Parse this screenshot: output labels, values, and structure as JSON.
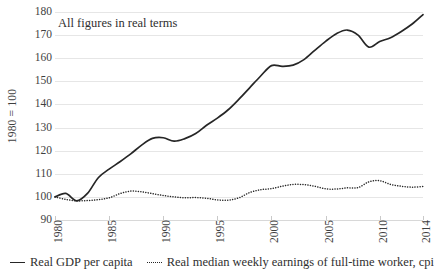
{
  "chart_data": {
    "type": "line",
    "title": "",
    "annotation": "All figures in real terms",
    "xlabel": "",
    "ylabel": "1980 = 100",
    "xlim": [
      1980,
      2014
    ],
    "ylim": [
      90,
      180
    ],
    "ytick_labels": [
      "180",
      "170",
      "160",
      "150",
      "140",
      "130",
      "120",
      "110",
      "100",
      "90"
    ],
    "ytick_values": [
      180,
      170,
      160,
      150,
      140,
      130,
      120,
      110,
      100,
      90
    ],
    "xtick_labels": [
      "1980",
      "1985",
      "1990",
      "1995",
      "2000",
      "2005",
      "2010",
      "2014"
    ],
    "xtick_values": [
      1980,
      1985,
      1990,
      1995,
      2000,
      2005,
      2010,
      2014
    ],
    "grid": true,
    "legend_position": "bottom",
    "x": [
      1980,
      1981,
      1982,
      1983,
      1984,
      1985,
      1986,
      1987,
      1988,
      1989,
      1990,
      1991,
      1992,
      1993,
      1994,
      1995,
      1996,
      1997,
      1998,
      1999,
      2000,
      2001,
      2002,
      2003,
      2004,
      2005,
      2006,
      2007,
      2008,
      2009,
      2010,
      2011,
      2012,
      2013,
      2014
    ],
    "series": [
      {
        "name": "Real GDP per capita",
        "style": "solid",
        "color": "#262626",
        "values": [
          100.0,
          101.5,
          98.3,
          101.5,
          108.3,
          112.0,
          115.2,
          118.6,
          122.4,
          125.3,
          125.6,
          124.1,
          125.2,
          127.4,
          131.0,
          134.1,
          137.7,
          142.3,
          147.3,
          152.3,
          156.8,
          156.5,
          157.0,
          159.4,
          163.4,
          167.3,
          170.6,
          172.2,
          170.0,
          164.8,
          167.2,
          168.9,
          171.6,
          174.8,
          178.9
        ]
      },
      {
        "name": "Real median weekly earnings of full-time worker, cpi",
        "style": "dotted",
        "color": "#262626",
        "values": [
          100.0,
          98.9,
          98.3,
          98.4,
          98.8,
          99.6,
          101.4,
          102.5,
          102.2,
          101.4,
          100.6,
          100.0,
          99.6,
          99.7,
          99.4,
          98.7,
          98.6,
          99.6,
          101.9,
          103.1,
          103.6,
          104.6,
          105.4,
          105.3,
          104.6,
          103.5,
          103.4,
          103.9,
          104.0,
          106.5,
          107.0,
          105.4,
          104.6,
          104.2,
          104.5
        ]
      }
    ]
  },
  "legend": {
    "items": [
      {
        "label": "Real GDP per capita",
        "style": "solid"
      },
      {
        "label": "Real median weekly earnings of full-time worker, cpi",
        "style": "dotted"
      }
    ]
  }
}
